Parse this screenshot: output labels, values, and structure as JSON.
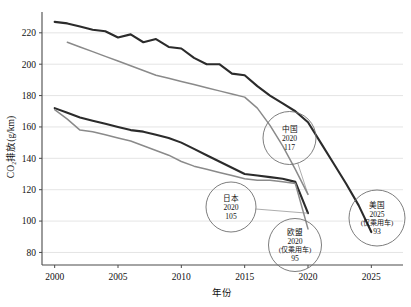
{
  "chart_data": {
    "type": "line",
    "title": "",
    "xlabel": "年份",
    "ylabel": "CO₂排放(g/km)",
    "xlim": [
      1999,
      2027.5
    ],
    "ylim": [
      72,
      232
    ],
    "xticks": [
      2000,
      2005,
      2010,
      2015,
      2020,
      2025
    ],
    "xtick_labels": [
      "2000",
      "2005",
      "2010",
      "2015",
      "2020",
      "2025"
    ],
    "yticks": [
      80,
      100,
      120,
      140,
      160,
      180,
      200,
      220
    ],
    "ytick_labels": [
      "80",
      "100",
      "120",
      "140",
      "160",
      "180",
      "200",
      "220"
    ],
    "grid": "horizontal",
    "legend": "none",
    "series": [
      {
        "name": "美国",
        "color": "#2b2b2b",
        "width": 2.1,
        "x": [
          2000,
          2001,
          2002,
          2003,
          2004,
          2005,
          2006,
          2007,
          2008,
          2009,
          2010,
          2011,
          2012,
          2013,
          2014,
          2015,
          2016,
          2017,
          2018,
          2019,
          2020,
          2021,
          2022,
          2023,
          2024,
          2025
        ],
        "y": [
          227,
          226,
          224,
          222,
          221,
          217,
          219,
          214,
          216,
          211,
          210,
          204,
          200,
          200,
          194,
          193,
          186,
          180,
          175,
          170,
          163,
          150,
          137,
          124,
          110,
          93
        ]
      },
      {
        "name": "中国",
        "color": "#8a8a8a",
        "width": 1.5,
        "x": [
          2001,
          2002,
          2003,
          2004,
          2005,
          2006,
          2007,
          2008,
          2009,
          2010,
          2011,
          2012,
          2013,
          2014,
          2015,
          2016,
          2017,
          2018,
          2019,
          2020
        ],
        "y": [
          214,
          211,
          208,
          205,
          202,
          199,
          196,
          193,
          191,
          189,
          187,
          185,
          183,
          181,
          179,
          172,
          161,
          148,
          133,
          117
        ]
      },
      {
        "name": "日本",
        "color": "#2b2b2b",
        "width": 2.1,
        "x": [
          2000,
          2001,
          2002,
          2003,
          2004,
          2005,
          2006,
          2007,
          2008,
          2009,
          2010,
          2011,
          2012,
          2013,
          2014,
          2015,
          2016,
          2017,
          2018,
          2019,
          2020
        ],
        "y": [
          172,
          169,
          166,
          164,
          162,
          160,
          158,
          157,
          155,
          153,
          150,
          146,
          142,
          138,
          134,
          130,
          129,
          128,
          127,
          125,
          105
        ]
      },
      {
        "name": "欧盟",
        "color": "#8a8a8a",
        "width": 1.5,
        "x": [
          2000,
          2001,
          2002,
          2003,
          2004,
          2005,
          2006,
          2007,
          2008,
          2009,
          2010,
          2011,
          2012,
          2013,
          2014,
          2015,
          2016,
          2017,
          2018,
          2019,
          2020
        ],
        "y": [
          171,
          165,
          158,
          157,
          155,
          153,
          151,
          148,
          145,
          142,
          138,
          135,
          133,
          131,
          129,
          127,
          126,
          126,
          125,
          124,
          95
        ]
      }
    ],
    "annotations": [
      {
        "id": "china",
        "lines": [
          "中国",
          "2020",
          "117"
        ],
        "cx": 289.5,
        "cy": 138.0,
        "r": 26.5,
        "target_x": 2020,
        "target_y": 117
      },
      {
        "id": "japan",
        "lines": [
          "日本",
          "2020",
          "105"
        ],
        "cx": 231.0,
        "cy": 207.0,
        "r": 25.0,
        "target_x": 2020,
        "target_y": 105
      },
      {
        "id": "eu",
        "lines": [
          "欧盟",
          "2020",
          "(仅乘用车)",
          "95"
        ],
        "cx": 295.0,
        "cy": 245.0,
        "r": 26.5,
        "target_x": 2020,
        "target_y": 95
      },
      {
        "id": "usa",
        "lines": [
          "美国",
          "2025",
          "(仅乘用车)",
          "93"
        ],
        "cx": 377.0,
        "cy": 218.0,
        "r": 28.0,
        "target_x": 2025,
        "target_y": 93
      }
    ]
  }
}
